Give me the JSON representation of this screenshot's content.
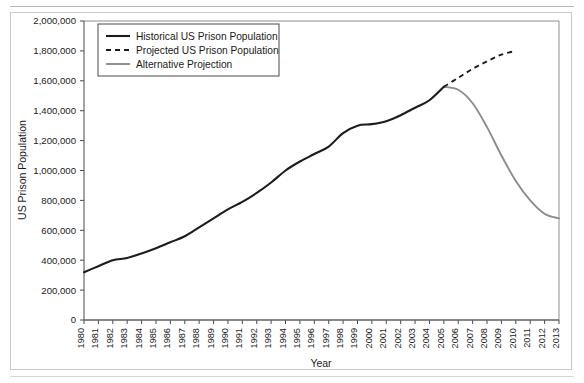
{
  "chart_data": {
    "type": "line",
    "title": "",
    "xlabel": "Year",
    "ylabel": "US Prison Population",
    "xlim": [
      1980,
      2013
    ],
    "ylim": [
      0,
      2000000
    ],
    "grid": false,
    "legend_position": "top-left",
    "ytick_labels": [
      "0",
      "200,000",
      "400,000",
      "600,000",
      "800,000",
      "1,000,000",
      "1,200,000",
      "1,400,000",
      "1,600,000",
      "1,800,000",
      "2,000,000"
    ],
    "ytick_values": [
      0,
      200000,
      400000,
      600000,
      800000,
      1000000,
      1200000,
      1400000,
      1600000,
      1800000,
      2000000
    ],
    "xtick_labels": [
      "1980",
      "1981",
      "1982",
      "1983",
      "1984",
      "1985",
      "1986",
      "1987",
      "1988",
      "1989",
      "1990",
      "1991",
      "1992",
      "1993",
      "1994",
      "1995",
      "1996",
      "1997",
      "1998",
      "1999",
      "2000",
      "2001",
      "2002",
      "2003",
      "2004",
      "2005",
      "2006",
      "2007",
      "2008",
      "2009",
      "2010",
      "2011",
      "2012",
      "2013"
    ],
    "series": [
      {
        "name": "Historical US Prison Population",
        "style": "solid",
        "color": "#1c1c1c",
        "x": [
          1980,
          1981,
          1982,
          1983,
          1984,
          1985,
          1986,
          1987,
          1988,
          1989,
          1990,
          1991,
          1992,
          1993,
          1994,
          1995,
          1996,
          1997,
          1998,
          1999,
          2000,
          2001,
          2002,
          2003,
          2004,
          2005
        ],
        "values": [
          320000,
          360000,
          400000,
          415000,
          445000,
          480000,
          520000,
          560000,
          620000,
          680000,
          740000,
          790000,
          850000,
          920000,
          1000000,
          1060000,
          1110000,
          1160000,
          1250000,
          1300000,
          1310000,
          1330000,
          1370000,
          1420000,
          1470000,
          1560000
        ]
      },
      {
        "name": "Projected US Prison Population",
        "style": "dashed",
        "color": "#1c1c1c",
        "x": [
          2005,
          2006,
          2007,
          2008,
          2009,
          2010
        ],
        "values": [
          1560000,
          1620000,
          1680000,
          1730000,
          1775000,
          1800000
        ]
      },
      {
        "name": "Alternative Projection",
        "style": "solid",
        "color": "#8c8c8c",
        "x": [
          2005,
          2006,
          2007,
          2008,
          2009,
          2010,
          2011,
          2012,
          2013
        ],
        "values": [
          1560000,
          1540000,
          1450000,
          1290000,
          1100000,
          930000,
          800000,
          710000,
          680000
        ]
      }
    ],
    "legend_entries": [
      "Historical US Prison Population",
      "Projected US Prison Population",
      "Alternative Projection"
    ]
  }
}
